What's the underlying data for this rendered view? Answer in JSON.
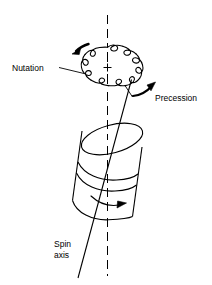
{
  "figure": {
    "background_color": "#ffffff",
    "line_color": "#000000",
    "width": 212,
    "height": 285
  },
  "labels": {
    "nutation": "Nutation",
    "precession": "Precession",
    "spin_axis_line1": "Spin",
    "spin_axis_line2": "axis"
  },
  "parts": {
    "vertical_axis_name": "vertical-reference-axis",
    "center_mark": "+",
    "nutation_loop_count": 13,
    "nutation_arrow_direction": "counterclockwise",
    "precession_arrow_direction": "clockwise-upward",
    "spin_arrow_direction": "rightward",
    "cylinder_name": "spinning-top-cylinder"
  }
}
